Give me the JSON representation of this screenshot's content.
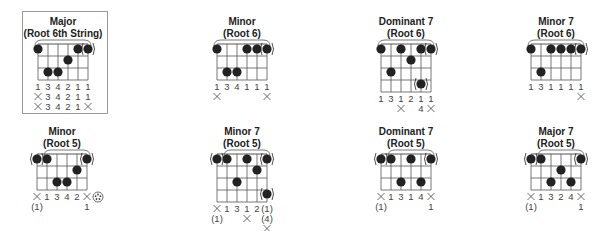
{
  "chords": [
    {
      "id": "major-root6",
      "title1": "Major",
      "title2": "(Root 6th String)",
      "boxed": true,
      "pos": {
        "x": 3,
        "y": 16
      },
      "strings": 6,
      "frets": 3,
      "dots": [
        {
          "s": 0,
          "f": 0
        },
        {
          "s": 4,
          "f": 0
        },
        {
          "s": 5,
          "f": 0,
          "paren": true
        },
        {
          "s": 3,
          "f": 1
        },
        {
          "s": 1,
          "f": 2
        },
        {
          "s": 2,
          "f": 2
        }
      ],
      "barre": {
        "from": 0,
        "to": 5
      },
      "rows": [
        [
          "1",
          "3",
          "4",
          "2",
          "1",
          "1"
        ],
        [
          "x",
          "3",
          "4",
          "2",
          "1",
          "1"
        ],
        [
          "x",
          "3",
          "4",
          "2",
          "1",
          "x"
        ]
      ]
    },
    {
      "id": "minor-root6",
      "title1": "Minor",
      "title2": "(Root 6)",
      "pos": {
        "x": 182,
        "y": 16
      },
      "strings": 6,
      "frets": 3,
      "dots": [
        {
          "s": 0,
          "f": 0
        },
        {
          "s": 3,
          "f": 0
        },
        {
          "s": 4,
          "f": 0
        },
        {
          "s": 5,
          "f": 0,
          "paren": true
        },
        {
          "s": 1,
          "f": 2
        },
        {
          "s": 2,
          "f": 2
        }
      ],
      "barre": {
        "from": 0,
        "to": 5
      },
      "rows": [
        [
          "1",
          "3",
          "4",
          "1",
          "1",
          "1"
        ],
        [
          "x",
          "",
          "",
          "",
          "",
          "x"
        ]
      ]
    },
    {
      "id": "dominant7-root6",
      "title1": "Dominant 7",
      "title2": "(Root 6)",
      "pos": {
        "x": 346,
        "y": 16
      },
      "strings": 6,
      "frets": 4,
      "dots": [
        {
          "s": 0,
          "f": 0
        },
        {
          "s": 2,
          "f": 0
        },
        {
          "s": 4,
          "f": 0
        },
        {
          "s": 5,
          "f": 0,
          "paren": true
        },
        {
          "s": 3,
          "f": 1
        },
        {
          "s": 1,
          "f": 2
        },
        {
          "s": 4,
          "f": 3,
          "paren": true
        }
      ],
      "barre": {
        "from": 0,
        "to": 5
      },
      "rows": [
        [
          "1",
          "3",
          "1",
          "2",
          "1",
          "1"
        ],
        [
          "",
          "",
          "x",
          "",
          "4",
          "x"
        ]
      ]
    },
    {
      "id": "minor7-root6",
      "title1": "Minor 7",
      "title2": "(Root 6)",
      "pos": {
        "x": 496,
        "y": 16
      },
      "strings": 6,
      "frets": 3,
      "dots": [
        {
          "s": 0,
          "f": 0
        },
        {
          "s": 2,
          "f": 0
        },
        {
          "s": 3,
          "f": 0
        },
        {
          "s": 4,
          "f": 0
        },
        {
          "s": 5,
          "f": 0,
          "paren": true
        },
        {
          "s": 1,
          "f": 2
        }
      ],
      "barre": {
        "from": 0,
        "to": 5
      },
      "rows": [
        [
          "1",
          "3",
          "1",
          "1",
          "1",
          "1"
        ],
        [
          "",
          "",
          "",
          "",
          "",
          "x"
        ]
      ]
    },
    {
      "id": "minor-root5",
      "title1": "Minor",
      "title2": "(Root 5)",
      "pos": {
        "x": 2,
        "y": 126
      },
      "strings": 6,
      "frets": 3,
      "dots": [
        {
          "s": 0,
          "f": 0,
          "paren": true
        },
        {
          "s": 1,
          "f": 0
        },
        {
          "s": 5,
          "f": 0,
          "paren": true
        },
        {
          "s": 4,
          "f": 1
        },
        {
          "s": 2,
          "f": 2
        },
        {
          "s": 3,
          "f": 2
        }
      ],
      "barre": {
        "from": 1,
        "to": 5
      },
      "rows": [
        [
          "x",
          "1",
          "3",
          "4",
          "2",
          "x"
        ],
        [
          "(1)",
          "",
          "",
          "",
          "",
          "1"
        ]
      ],
      "extra_symbol": "circled-dots"
    },
    {
      "id": "minor7-root5",
      "title1": "Minor 7",
      "title2": "(Root 5)",
      "pos": {
        "x": 182,
        "y": 126
      },
      "strings": 6,
      "frets": 4,
      "dots": [
        {
          "s": 0,
          "f": 0,
          "paren": true
        },
        {
          "s": 1,
          "f": 0
        },
        {
          "s": 3,
          "f": 0
        },
        {
          "s": 5,
          "f": 0,
          "paren": true
        },
        {
          "s": 4,
          "f": 1
        },
        {
          "s": 2,
          "f": 2
        },
        {
          "s": 5,
          "f": 3,
          "paren": true
        }
      ],
      "barre": {
        "from": 1,
        "to": 5
      },
      "rows": [
        [
          "x",
          "1",
          "3",
          "1",
          "2",
          "(1)"
        ],
        [
          "(1)",
          "",
          "",
          "x",
          "",
          "(4)"
        ],
        [
          "",
          "",
          "",
          "",
          "",
          "x"
        ]
      ]
    },
    {
      "id": "dominant7-root5",
      "title1": "Dominant 7",
      "title2": "(Root 5)",
      "pos": {
        "x": 346,
        "y": 126
      },
      "strings": 6,
      "frets": 3,
      "dots": [
        {
          "s": 0,
          "f": 0,
          "paren": true
        },
        {
          "s": 1,
          "f": 0
        },
        {
          "s": 3,
          "f": 0
        },
        {
          "s": 5,
          "f": 0,
          "paren": true
        },
        {
          "s": 2,
          "f": 2
        },
        {
          "s": 4,
          "f": 2
        }
      ],
      "barre": {
        "from": 1,
        "to": 5
      },
      "rows": [
        [
          "x",
          "1",
          "3",
          "1",
          "4",
          "x"
        ],
        [
          "(1)",
          "",
          "",
          "",
          "",
          "1"
        ]
      ]
    },
    {
      "id": "major7-root5",
      "title1": "Major 7",
      "title2": "(Root 5)",
      "pos": {
        "x": 496,
        "y": 126
      },
      "strings": 6,
      "frets": 3,
      "dots": [
        {
          "s": 0,
          "f": 0,
          "paren": true
        },
        {
          "s": 1,
          "f": 0
        },
        {
          "s": 5,
          "f": 0,
          "paren": true
        },
        {
          "s": 3,
          "f": 1
        },
        {
          "s": 2,
          "f": 2
        },
        {
          "s": 4,
          "f": 2
        }
      ],
      "barre": {
        "from": 1,
        "to": 5
      },
      "rows": [
        [
          "x",
          "1",
          "3",
          "2",
          "4",
          "x"
        ],
        [
          "(1)",
          "",
          "",
          "",
          "",
          "1"
        ]
      ]
    }
  ],
  "colors": {
    "ink": "#222222",
    "grid": "#555555",
    "label": "#444444",
    "frame": "#9a9a9a"
  }
}
